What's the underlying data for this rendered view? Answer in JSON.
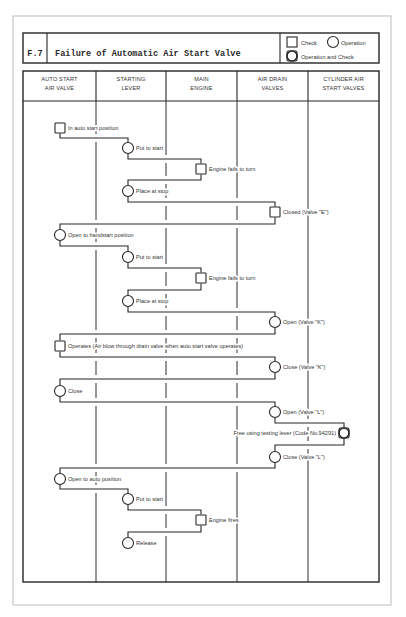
{
  "page": {
    "figure_id": "F.7",
    "title": "Failure of Automatic Air Start Valve"
  },
  "legend": {
    "check": "Check",
    "operation": "Operation",
    "operation_and_check": "Operation and Check"
  },
  "columns": [
    {
      "line1": "AUTO START",
      "line2": "AIR VALVE"
    },
    {
      "line1": "STARTING",
      "line2": "LEVER"
    },
    {
      "line1": "MAIN",
      "line2": "ENGINE"
    },
    {
      "line1": "AIR DRAIN",
      "line2": "VALVES"
    },
    {
      "line1": "CYLINDER AIR",
      "line2": "START VALVES"
    }
  ],
  "steps": [
    {
      "lane": 0,
      "shape": "check",
      "label": "In auto start position"
    },
    {
      "lane": 1,
      "shape": "operation",
      "label": "Put to start"
    },
    {
      "lane": 2,
      "shape": "check",
      "label": "Engine fails to turn"
    },
    {
      "lane": 1,
      "shape": "operation",
      "label": "Place at stop"
    },
    {
      "lane": 3,
      "shape": "check",
      "label": "Closed (Valve \"E\")"
    },
    {
      "lane": 0,
      "shape": "operation",
      "label": "Open to handstart position"
    },
    {
      "lane": 1,
      "shape": "operation",
      "label": "Put to start"
    },
    {
      "lane": 2,
      "shape": "check",
      "label": "Engine fails to turn"
    },
    {
      "lane": 1,
      "shape": "operation",
      "label": "Place at stop"
    },
    {
      "lane": 3,
      "shape": "operation",
      "label": "Open (Valve \"K\")"
    },
    {
      "lane": 0,
      "shape": "check",
      "label": "Operates (Air blow through drain valve when auto start valve operates)"
    },
    {
      "lane": 3,
      "shape": "operation",
      "label": "Close (Valve \"K\")"
    },
    {
      "lane": 0,
      "shape": "operation",
      "label": "Close"
    },
    {
      "lane": 3,
      "shape": "operation",
      "label": "Open (Valve \"L\")"
    },
    {
      "lane": 4,
      "shape": "operation_and_check",
      "label": "Free using testing lever (Code No.94291)",
      "label_side": "left"
    },
    {
      "lane": 3,
      "shape": "operation",
      "label": "Close (Valve \"L\")"
    },
    {
      "lane": 0,
      "shape": "operation",
      "label": "Open to auto position"
    },
    {
      "lane": 1,
      "shape": "operation",
      "label": "Put to start"
    },
    {
      "lane": 2,
      "shape": "check",
      "label": "Engine fires"
    },
    {
      "lane": 1,
      "shape": "operation",
      "label": "Release"
    }
  ],
  "colors": {
    "line": "#262626",
    "text": "#333333",
    "page_border": "#b3b3b3",
    "background": "#ffffff"
  }
}
